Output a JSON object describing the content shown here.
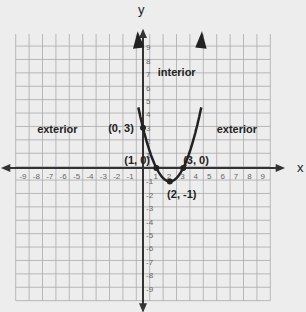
{
  "axes": {
    "x_label": "x",
    "y_label": "y",
    "x_range": [
      -9,
      9
    ],
    "y_range": [
      -9,
      9
    ]
  },
  "x_ticks": [
    "-9",
    "-8",
    "-7",
    "-6",
    "-5",
    "-4",
    "-3",
    "-2",
    "-1",
    "1",
    "2",
    "3",
    "4",
    "5",
    "6",
    "7",
    "8",
    "9"
  ],
  "y_ticks": [
    "9",
    "8",
    "7",
    "6",
    "5",
    "4",
    "3",
    "2",
    "1",
    "-1",
    "-2",
    "-3",
    "-4",
    "-5",
    "-6",
    "-7",
    "-8",
    "-9"
  ],
  "regions": {
    "interior": "interior",
    "exterior_left": "exterior",
    "exterior_right": "exterior"
  },
  "points": [
    {
      "label": "(0, 3)",
      "x": 0,
      "y": 3
    },
    {
      "label": "(1, 0)",
      "x": 1,
      "y": 0
    },
    {
      "label": "(3, 0)",
      "x": 3,
      "y": 0
    },
    {
      "label": "(2, -1)",
      "x": 2,
      "y": -1
    }
  ],
  "curve": {
    "equation": "y = (x-2)^2 - 1",
    "vertex": [
      2,
      -1
    ]
  },
  "colors": {
    "background": "#ededed",
    "grid": "#aaaaaa",
    "axis": "#333333",
    "curve": "#222222"
  }
}
